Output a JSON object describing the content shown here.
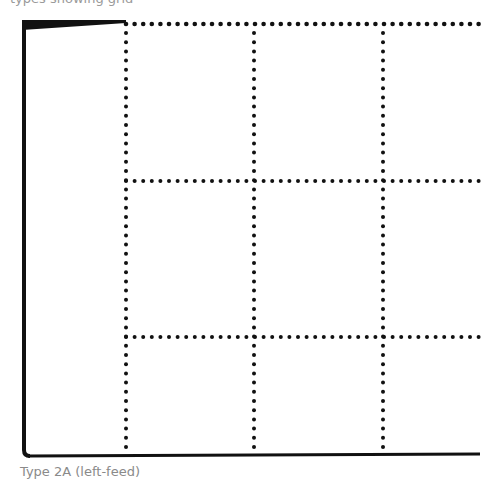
{
  "diagram": {
    "top_caption": "types showing grid",
    "bottom_caption": "Type 2A (left-feed)",
    "colors": {
      "line": "#111111",
      "background": "#ffffff",
      "caption": "#8a8a8a"
    },
    "frame": {
      "left_edge": "solid",
      "bottom_edge": "solid",
      "top_edge": "tapered solid then dotted",
      "right_edge": "open"
    },
    "grid": {
      "vertical_dotted_lines_x": [
        126,
        254,
        383
      ],
      "horizontal_dotted_lines_y": [
        24,
        181,
        337
      ],
      "columns": 4,
      "rows": 3
    }
  }
}
